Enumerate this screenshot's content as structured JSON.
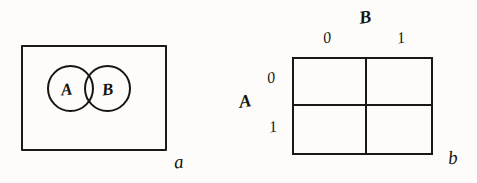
{
  "figure": {
    "background_color": "#fdfcfb",
    "ink_color": "#1a1814"
  },
  "panel_a": {
    "caption": "a",
    "universe": {
      "name": "universal-set-rectangle"
    },
    "circles": [
      {
        "label": "A",
        "name": "set-circle-a"
      },
      {
        "label": "B",
        "name": "set-circle-b"
      }
    ]
  },
  "panel_b": {
    "caption": "b",
    "row_variable": "A",
    "column_variable": "B",
    "column_ticks": [
      "0",
      "1"
    ],
    "row_ticks": [
      "0",
      "1"
    ],
    "cells": [
      {
        "row": "0",
        "col": "0",
        "value": ""
      },
      {
        "row": "0",
        "col": "1",
        "value": ""
      },
      {
        "row": "1",
        "col": "0",
        "value": ""
      },
      {
        "row": "1",
        "col": "1",
        "value": ""
      }
    ]
  }
}
